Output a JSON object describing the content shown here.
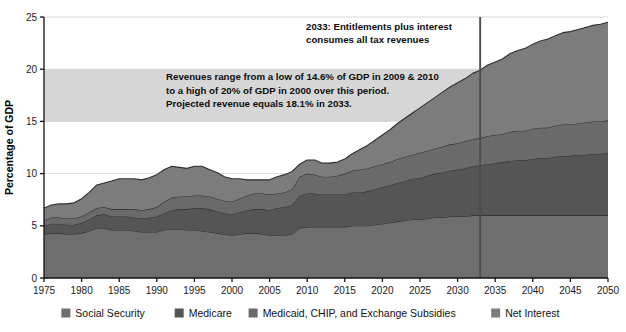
{
  "chart_data": {
    "type": "area",
    "title": "",
    "xlabel": "",
    "ylabel": "Percentage of GDP",
    "xlim": [
      1975,
      2050
    ],
    "ylim": [
      0,
      25
    ],
    "grid": true,
    "legend_position": "bottom",
    "y_ticks": [
      "0",
      "5",
      "10",
      "15",
      "20",
      "25"
    ],
    "y_tick_values": [
      0,
      5,
      10,
      15,
      20,
      25
    ],
    "x_ticks": [
      "1975",
      "1980",
      "1985",
      "1990",
      "1995",
      "2000",
      "2005",
      "2010",
      "2015",
      "2020",
      "2025",
      "2030",
      "2035",
      "2040",
      "2045",
      "2050"
    ],
    "x_tick_values": [
      1975,
      1980,
      1985,
      1990,
      1995,
      2000,
      2005,
      2010,
      2015,
      2020,
      2025,
      2030,
      2035,
      2040,
      2045,
      2050
    ],
    "x": [
      1975,
      1976,
      1977,
      1978,
      1979,
      1980,
      1981,
      1982,
      1983,
      1984,
      1985,
      1986,
      1987,
      1988,
      1989,
      1990,
      1991,
      1992,
      1993,
      1994,
      1995,
      1996,
      1997,
      1998,
      1999,
      2000,
      2001,
      2002,
      2003,
      2004,
      2005,
      2006,
      2007,
      2008,
      2009,
      2010,
      2011,
      2012,
      2013,
      2014,
      2015,
      2016,
      2017,
      2018,
      2019,
      2020,
      2021,
      2022,
      2023,
      2024,
      2025,
      2026,
      2027,
      2028,
      2029,
      2030,
      2031,
      2032,
      2033,
      2034,
      2035,
      2036,
      2037,
      2038,
      2039,
      2040,
      2041,
      2042,
      2043,
      2044,
      2045,
      2046,
      2047,
      2048,
      2049,
      2050
    ],
    "series": [
      {
        "name": "Social Security",
        "color": "#6e6e6e",
        "values": [
          4.2,
          4.3,
          4.3,
          4.2,
          4.2,
          4.3,
          4.5,
          4.8,
          4.8,
          4.6,
          4.6,
          4.6,
          4.5,
          4.4,
          4.4,
          4.4,
          4.6,
          4.7,
          4.7,
          4.6,
          4.6,
          4.5,
          4.4,
          4.3,
          4.2,
          4.1,
          4.2,
          4.3,
          4.3,
          4.2,
          4.1,
          4.1,
          4.1,
          4.2,
          4.8,
          4.9,
          4.9,
          4.9,
          4.9,
          4.9,
          4.9,
          5.0,
          5.0,
          5.0,
          5.1,
          5.2,
          5.3,
          5.4,
          5.5,
          5.6,
          5.6,
          5.7,
          5.8,
          5.8,
          5.9,
          5.9,
          5.9,
          6.0,
          6.0,
          6.0,
          6.0,
          6.0,
          6.0,
          6.0,
          6.0,
          6.0,
          6.0,
          6.0,
          6.0,
          6.0,
          6.0,
          6.0,
          6.0,
          6.0,
          6.0,
          6.0
        ]
      },
      {
        "name": "Medicare",
        "color": "#555555",
        "values": [
          0.8,
          0.9,
          0.9,
          0.9,
          0.9,
          1.0,
          1.1,
          1.2,
          1.3,
          1.3,
          1.3,
          1.3,
          1.3,
          1.3,
          1.4,
          1.5,
          1.6,
          1.8,
          1.9,
          2.0,
          2.1,
          2.2,
          2.2,
          2.1,
          2.0,
          2.0,
          2.1,
          2.2,
          2.3,
          2.4,
          2.4,
          2.6,
          2.7,
          2.8,
          3.1,
          3.2,
          3.2,
          3.1,
          3.1,
          3.1,
          3.1,
          3.2,
          3.2,
          3.3,
          3.4,
          3.5,
          3.6,
          3.7,
          3.8,
          3.9,
          4.0,
          4.1,
          4.2,
          4.3,
          4.4,
          4.5,
          4.6,
          4.7,
          4.8,
          4.9,
          5.0,
          5.1,
          5.2,
          5.3,
          5.3,
          5.4,
          5.5,
          5.5,
          5.6,
          5.7,
          5.7,
          5.8,
          5.8,
          5.9,
          5.9,
          6.0
        ]
      },
      {
        "name": "Medicaid, CHIP, and Exchange Subsidies",
        "color": "#6a6a6a",
        "values": [
          0.5,
          0.6,
          0.6,
          0.6,
          0.6,
          0.6,
          0.7,
          0.7,
          0.7,
          0.7,
          0.7,
          0.7,
          0.8,
          0.8,
          0.8,
          0.9,
          1.1,
          1.2,
          1.2,
          1.2,
          1.2,
          1.2,
          1.2,
          1.2,
          1.2,
          1.2,
          1.3,
          1.4,
          1.5,
          1.5,
          1.5,
          1.4,
          1.4,
          1.5,
          1.8,
          1.9,
          1.8,
          1.7,
          1.7,
          1.8,
          2.0,
          2.1,
          2.2,
          2.2,
          2.2,
          2.2,
          2.2,
          2.3,
          2.3,
          2.3,
          2.4,
          2.4,
          2.4,
          2.5,
          2.5,
          2.5,
          2.6,
          2.6,
          2.6,
          2.7,
          2.7,
          2.7,
          2.8,
          2.8,
          2.8,
          2.9,
          2.9,
          2.9,
          3.0,
          3.0,
          3.0,
          3.0,
          3.1,
          3.1,
          3.1,
          3.1
        ]
      },
      {
        "name": "Net Interest",
        "color": "#7c7c7c",
        "values": [
          1.2,
          1.2,
          1.3,
          1.4,
          1.5,
          1.7,
          1.9,
          2.2,
          2.3,
          2.7,
          2.9,
          2.9,
          2.9,
          2.9,
          3.0,
          3.1,
          3.1,
          3.0,
          2.8,
          2.7,
          2.8,
          2.8,
          2.6,
          2.5,
          2.3,
          2.2,
          1.9,
          1.5,
          1.3,
          1.3,
          1.4,
          1.6,
          1.7,
          1.7,
          1.2,
          1.3,
          1.4,
          1.3,
          1.3,
          1.3,
          1.4,
          1.6,
          1.9,
          2.2,
          2.5,
          2.8,
          3.1,
          3.4,
          3.7,
          4.0,
          4.3,
          4.6,
          4.9,
          5.2,
          5.5,
          5.8,
          6.0,
          6.3,
          6.5,
          6.8,
          7.0,
          7.2,
          7.5,
          7.7,
          7.9,
          8.1,
          8.3,
          8.5,
          8.6,
          8.8,
          8.9,
          9.0,
          9.1,
          9.2,
          9.3,
          9.4
        ]
      }
    ],
    "revenue_band": {
      "label": "Revenue range",
      "low": 14.6,
      "high": 20,
      "fill_color": "#d2d2d2"
    },
    "marker_line": {
      "year": 2033,
      "color": "#4d4d4d"
    },
    "annotations": [
      {
        "name": "marker-annotation",
        "lines": [
          "2033: Entitlements plus interest",
          "consumes all tax revenues"
        ]
      },
      {
        "name": "revenue-band-annotation",
        "lines": [
          "Revenues range from a low of 14.6% of GDP in 2009 & 2010",
          "to a high of 20% of GDP in 2000 over this period.",
          "Projected revenue equals 18.1% in 2033."
        ]
      }
    ],
    "legend": [
      {
        "label": "Social Security",
        "color": "#6e6e6e"
      },
      {
        "label": "Medicare",
        "color": "#555555"
      },
      {
        "label": "Medicaid, CHIP, and Exchange Subsidies",
        "color": "#6a6a6a"
      },
      {
        "label": "Net Interest",
        "color": "#7c7c7c"
      }
    ]
  }
}
